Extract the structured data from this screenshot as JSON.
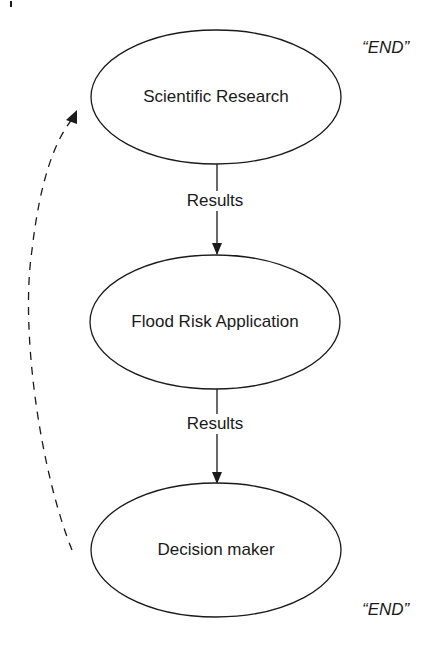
{
  "diagram": {
    "nodes": [
      {
        "id": "scientific-research",
        "label": "Scientific Research"
      },
      {
        "id": "flood-risk-application",
        "label": "Flood Risk Application"
      },
      {
        "id": "decision-maker",
        "label": "Decision maker"
      }
    ],
    "edges": [
      {
        "from": "scientific-research",
        "to": "flood-risk-application",
        "label": "Results",
        "style": "solid"
      },
      {
        "from": "flood-risk-application",
        "to": "decision-maker",
        "label": "Results",
        "style": "solid"
      },
      {
        "from": "decision-maker",
        "to": "scientific-research",
        "label": "",
        "style": "dashed"
      }
    ],
    "end_markers": [
      {
        "label": "“END”"
      },
      {
        "label": "“END”"
      }
    ],
    "colors": {
      "stroke": "#1a1a1a",
      "background": "#ffffff"
    }
  }
}
